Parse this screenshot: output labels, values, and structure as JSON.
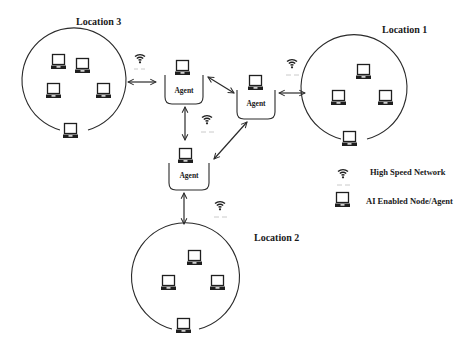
{
  "diagram": {
    "type": "network-topology",
    "colors": {
      "ink": "#2a2a2a",
      "background": "#ffffff",
      "dash": "#bdbdbd"
    },
    "locations": [
      {
        "id": "loc3",
        "label": "Location 3",
        "nodes": 6
      },
      {
        "id": "loc1",
        "label": "Location 1",
        "nodes": 4
      },
      {
        "id": "loc2",
        "label": "Location 2",
        "nodes": 4
      }
    ],
    "agents": [
      {
        "id": "agent-top-left",
        "label": "Agent"
      },
      {
        "id": "agent-top-right",
        "label": "Agent"
      },
      {
        "id": "agent-bottom",
        "label": "Agent"
      }
    ],
    "connections": [
      {
        "from": "Location 3",
        "to": "agent-top-left",
        "kind": "high-speed-network"
      },
      {
        "from": "agent-top-left",
        "to": "agent-top-right",
        "kind": "bidirectional"
      },
      {
        "from": "agent-top-right",
        "to": "Location 1",
        "kind": "high-speed-network"
      },
      {
        "from": "agent-top-left",
        "to": "agent-bottom",
        "kind": "high-speed-network"
      },
      {
        "from": "agent-top-right",
        "to": "agent-bottom",
        "kind": "bidirectional"
      },
      {
        "from": "agent-bottom",
        "to": "Location 2",
        "kind": "high-speed-network"
      }
    ],
    "legend": [
      {
        "icon": "wifi-icon",
        "label": "High Speed Network"
      },
      {
        "icon": "laptop-icon",
        "label": "AI Enabled Node/Agent"
      }
    ]
  }
}
